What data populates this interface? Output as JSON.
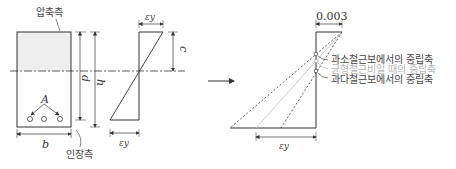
{
  "labels": {
    "compression_side": "압축측",
    "tension_side": "인장측",
    "d": "d",
    "h": "h",
    "b": "b",
    "A": "A",
    "c": "c",
    "eps_y_top": "εy",
    "eps_y_bottom": "εy",
    "eps_y_right": "εy",
    "concrete_strain": "0.003"
  },
  "neutral_axes": [
    {
      "label": "과소철근보에서의 중립축",
      "color": "#444444"
    },
    {
      "label": "균형철근비일 때의 중립축",
      "color": "#b5b5b5"
    },
    {
      "label": "과다철근보에서의 중립축",
      "color": "#444444"
    }
  ],
  "colors": {
    "line": "#333333",
    "shade": "#eeeeee",
    "gray_line": "#bbbbbb"
  }
}
